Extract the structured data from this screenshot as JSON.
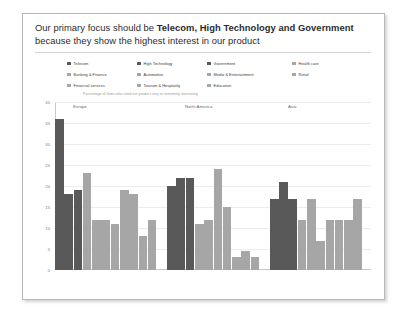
{
  "slide": {
    "title_line1_prefix": "Our primary focus should be ",
    "title_line1_strong": "Telecom, High Technology and Government",
    "title_line2": "because they show the highest interest in our product"
  },
  "legend": {
    "items": [
      {
        "label": "Telecom",
        "color": "#595959"
      },
      {
        "label": "High Technology",
        "color": "#595959"
      },
      {
        "label": "Government",
        "color": "#595959"
      },
      {
        "label": "Health care",
        "color": "#a6a6a6"
      },
      {
        "label": "Banking & Finance",
        "color": "#a6a6a6"
      },
      {
        "label": "Automotive",
        "color": "#a6a6a6"
      },
      {
        "label": "Media & Entertainment",
        "color": "#a6a6a6"
      },
      {
        "label": "Retail",
        "color": "#a6a6a6"
      },
      {
        "label": "Financial services",
        "color": "#a6a6a6"
      },
      {
        "label": "Tourism & Hospitality",
        "color": "#a6a6a6"
      },
      {
        "label": "Education",
        "color": "#a6a6a6"
      }
    ]
  },
  "chart_data": {
    "type": "bar",
    "title": "",
    "subtitle": "Percentage of firms who rated our product very or extremely interesting",
    "xlabel": "",
    "ylabel": "",
    "ylim": [
      0,
      40
    ],
    "yticks": [
      40,
      35,
      30,
      25,
      20,
      15,
      10,
      5,
      0
    ],
    "grid": true,
    "legend_position": "top",
    "highlight_color": "#595959",
    "normal_color": "#a6a6a6",
    "categories": [
      "Telecom",
      "High Technology",
      "Government",
      "Health care",
      "Banking & Finance",
      "Automotive",
      "Media & Entertainment",
      "Retail",
      "Financial services",
      "Tourism & Hospitality",
      "Education"
    ],
    "groups": [
      {
        "name": "Europe",
        "bars": [
          {
            "category": "Telecom",
            "value": 36,
            "highlight": true
          },
          {
            "category": "High Technology",
            "value": 18,
            "highlight": true
          },
          {
            "category": "Government",
            "value": 19,
            "highlight": true
          },
          {
            "category": "Health care",
            "value": 23,
            "highlight": false
          },
          {
            "category": "Banking & Finance",
            "value": 12,
            "highlight": false
          },
          {
            "category": "Automotive",
            "value": 12,
            "highlight": false
          },
          {
            "category": "Media & Entertainment",
            "value": 11,
            "highlight": false
          },
          {
            "category": "Retail",
            "value": 19,
            "highlight": false
          },
          {
            "category": "Financial services",
            "value": 18,
            "highlight": false
          },
          {
            "category": "Tourism & Hospitality",
            "value": 8,
            "highlight": false
          },
          {
            "category": "Education",
            "value": 12,
            "highlight": false
          }
        ]
      },
      {
        "name": "North America",
        "bars": [
          {
            "category": "Telecom",
            "value": 20,
            "highlight": true
          },
          {
            "category": "High Technology",
            "value": 22,
            "highlight": true
          },
          {
            "category": "Government",
            "value": 22,
            "highlight": true
          },
          {
            "category": "Health care",
            "value": 11,
            "highlight": false
          },
          {
            "category": "Banking & Finance",
            "value": 12,
            "highlight": false
          },
          {
            "category": "Automotive",
            "value": 24,
            "highlight": false
          },
          {
            "category": "Media & Entertainment",
            "value": 15,
            "highlight": false
          },
          {
            "category": "Retail",
            "value": 3,
            "highlight": false
          },
          {
            "category": "Financial services",
            "value": 4.5,
            "highlight": false
          },
          {
            "category": "Tourism & Hospitality",
            "value": 3,
            "highlight": false
          }
        ]
      },
      {
        "name": "Asia",
        "bars": [
          {
            "category": "Telecom",
            "value": 17,
            "highlight": true
          },
          {
            "category": "High Technology",
            "value": 21,
            "highlight": true
          },
          {
            "category": "Government",
            "value": 17,
            "highlight": true
          },
          {
            "category": "Health care",
            "value": 12,
            "highlight": false
          },
          {
            "category": "Banking & Finance",
            "value": 17,
            "highlight": false
          },
          {
            "category": "Automotive",
            "value": 7,
            "highlight": false
          },
          {
            "category": "Media & Entertainment",
            "value": 12,
            "highlight": false
          },
          {
            "category": "Retail",
            "value": 12,
            "highlight": false
          },
          {
            "category": "Financial services",
            "value": 12,
            "highlight": false
          },
          {
            "category": "Tourism & Hospitality",
            "value": 17,
            "highlight": false
          }
        ]
      }
    ]
  }
}
